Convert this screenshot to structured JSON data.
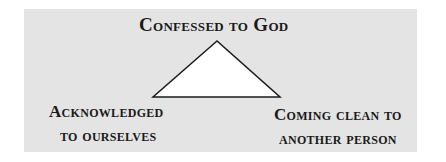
{
  "diagram": {
    "nodes": {
      "top": "Confessed to God",
      "left_line1": "Acknowledged",
      "left_line2": "to ourselves",
      "right_line1": "Coming clean to",
      "right_line2": "another person"
    },
    "shape": "triangle-icon",
    "colors": {
      "panel": "#e4e4e4",
      "triangle_fill": "#ffffff",
      "stroke": "#1a1a1a",
      "text": "#1a1a1a"
    }
  }
}
